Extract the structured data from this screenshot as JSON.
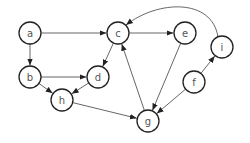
{
  "diagram": {
    "type": "directed-graph",
    "nodes": [
      {
        "id": "a",
        "label": "a",
        "x": 30,
        "y": 33
      },
      {
        "id": "b",
        "label": "b",
        "x": 30,
        "y": 77
      },
      {
        "id": "c",
        "label": "c",
        "x": 118,
        "y": 33
      },
      {
        "id": "d",
        "label": "d",
        "x": 98,
        "y": 77
      },
      {
        "id": "e",
        "label": "e",
        "x": 185,
        "y": 33
      },
      {
        "id": "f",
        "label": "f",
        "x": 194,
        "y": 82
      },
      {
        "id": "g",
        "label": "g",
        "x": 148,
        "y": 121
      },
      {
        "id": "h",
        "label": "h",
        "x": 62,
        "y": 100
      },
      {
        "id": "i",
        "label": "i",
        "x": 222,
        "y": 47
      }
    ],
    "edges": [
      {
        "from": "a",
        "to": "c"
      },
      {
        "from": "a",
        "to": "b"
      },
      {
        "from": "c",
        "to": "e"
      },
      {
        "from": "c",
        "to": "d"
      },
      {
        "from": "b",
        "to": "d"
      },
      {
        "from": "b",
        "to": "h"
      },
      {
        "from": "d",
        "to": "h"
      },
      {
        "from": "h",
        "to": "g"
      },
      {
        "from": "g",
        "to": "c"
      },
      {
        "from": "e",
        "to": "g"
      },
      {
        "from": "f",
        "to": "g"
      },
      {
        "from": "f",
        "to": "i"
      },
      {
        "from": "i",
        "to": "c",
        "curved": true
      }
    ],
    "node_radius": 11,
    "colors": {
      "stroke": "#222222",
      "edge": "#555555",
      "label": "#555555"
    }
  }
}
